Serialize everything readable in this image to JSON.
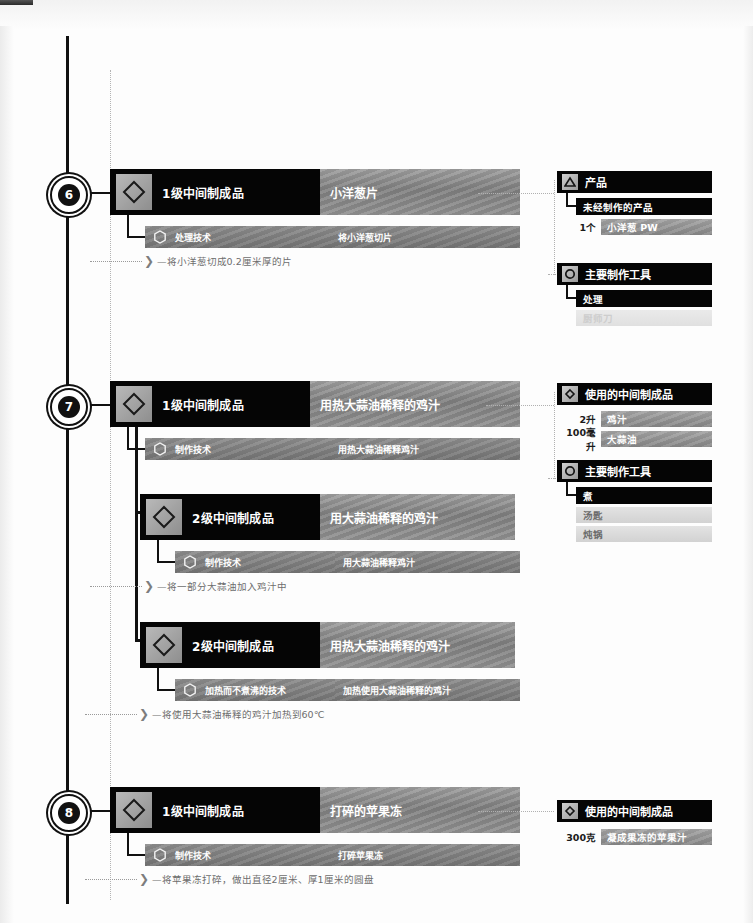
{
  "page": {
    "background": "#fdfdfd",
    "accent": "#050505",
    "bar_gray": "#8d8d8d"
  },
  "icons": {
    "node": "diamond-icon",
    "technique": "hexagon-icon",
    "product": "triangle-icon",
    "tool": "ring-icon",
    "intermediate": "diamond-icon"
  },
  "steps": [
    {
      "number": "6",
      "node": {
        "type_label": "1级中间制成品",
        "name": "小洋葱片"
      },
      "technique": {
        "label": "处理技术",
        "value": "将小洋葱切片"
      },
      "note": "—将小洋葱切成0.2厘米厚的片",
      "panels": [
        {
          "title": "产品",
          "icon": "triangle-icon",
          "subtitle": "未经制作的产品",
          "ingredients": [
            {
              "qty": "1个",
              "name": "小洋葱 PW"
            }
          ],
          "tools": []
        },
        {
          "title": "主要制作工具",
          "icon": "ring-icon",
          "subtitle": "处理",
          "ingredients": [],
          "tools": [
            {
              "name": "厨师刀",
              "faded": true
            }
          ]
        }
      ]
    },
    {
      "number": "7",
      "node": {
        "type_label": "1级中间制成品",
        "name": "用热大蒜油稀释的鸡汁"
      },
      "technique": {
        "label": "制作技术",
        "value": "用热大蒜油稀释鸡汁"
      },
      "note": null,
      "panels": [
        {
          "title": "使用的中间制成品",
          "icon": "diamond-icon",
          "subtitle": null,
          "ingredients": [
            {
              "qty": "2升",
              "name": "鸡汁"
            },
            {
              "qty": "100毫升",
              "name": "大蒜油"
            }
          ],
          "tools": []
        },
        {
          "title": "主要制作工具",
          "icon": "ring-icon",
          "subtitle": "煮",
          "ingredients": [],
          "tools": [
            {
              "name": "汤匙",
              "faded": false
            },
            {
              "name": "炖锅",
              "faded": false
            }
          ]
        }
      ],
      "children": [
        {
          "node": {
            "type_label": "2级中间制成品",
            "name": "用大蒜油稀释的鸡汁"
          },
          "technique": {
            "label": "制作技术",
            "value": "用大蒜油稀释鸡汁"
          },
          "note": "—将一部分大蒜油加入鸡汁中"
        },
        {
          "node": {
            "type_label": "2级中间制成品",
            "name": "用热大蒜油稀释的鸡汁"
          },
          "technique": {
            "label": "加热而不煮沸的技术",
            "value": "加热使用大蒜油稀释的鸡汁"
          },
          "note": "—将使用大蒜油稀释的鸡汁加热到60℃"
        }
      ]
    },
    {
      "number": "8",
      "node": {
        "type_label": "1级中间制成品",
        "name": "打碎的苹果冻"
      },
      "technique": {
        "label": "制作技术",
        "value": "打碎苹果冻"
      },
      "note": "—将苹果冻打碎，做出直径2厘米、厚1厘米的圆盘",
      "panels": [
        {
          "title": "使用的中间制成品",
          "icon": "diamond-icon",
          "subtitle": null,
          "ingredients": [
            {
              "qty": "300克",
              "name": "凝成果冻的苹果汁"
            }
          ],
          "tools": []
        }
      ]
    }
  ]
}
